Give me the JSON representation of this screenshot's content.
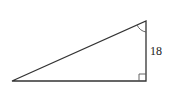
{
  "diagram": {
    "type": "right-triangle",
    "stroke_color": "#333333",
    "background": "#ffffff",
    "vertices": {
      "bottom_left": [
        12,
        81
      ],
      "top_right": [
        146,
        21
      ],
      "bottom_right": [
        146,
        81
      ]
    },
    "right_angle_marker": {
      "corner": "bottom_right",
      "size": 7
    },
    "angle_marker": {
      "vertex": "top_right",
      "type": "arc"
    },
    "labels": {
      "vertical_side": "18"
    }
  }
}
